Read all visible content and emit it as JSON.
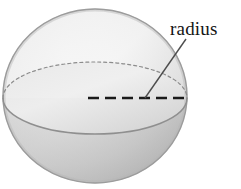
{
  "figure": {
    "name": "sphere-radius-diagram",
    "type": "geometry-illustration",
    "background_color": "#ffffff",
    "width": 241,
    "height": 189
  },
  "labels": {
    "radius": "radius"
  },
  "sphere": {
    "name": "sphere-shape",
    "center_x": 95,
    "center_y": 96,
    "radius_x": 92,
    "radius_y": 87,
    "outline_color": "#9a9a9a",
    "highlight_color": "#f2f2f2",
    "midtone_color": "#dcdcdc",
    "shadow_color": "#a8a8a8"
  },
  "equator": {
    "name": "equator-ellipse",
    "center_x": 95,
    "center_y": 98,
    "radius_x": 92,
    "radius_y": 36,
    "back_arc_style": "dotted",
    "front_arc_style": "solid",
    "line_color": "#8f8f8f"
  },
  "radius_line": {
    "name": "radius-dashed-line",
    "from_x": 88,
    "from_y": 98,
    "to_x": 184,
    "to_y": 98,
    "style": "dashed",
    "color": "#1a1a1a",
    "dash_length": 11,
    "dash_gap": 6,
    "thickness": 2
  },
  "leader_line": {
    "name": "label-leader-line",
    "from_x": 186,
    "from_y": 39,
    "to_x": 145,
    "to_y": 98,
    "color": "#4d4d4d",
    "thickness": 1.4
  }
}
